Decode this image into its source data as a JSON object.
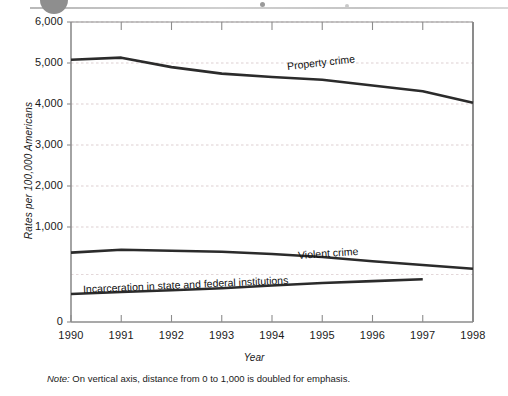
{
  "figure": {
    "note_prefix": "Note:",
    "note_text": " On vertical axis, distance from 0 to 1,000 is doubled for emphasis.",
    "artifact": {
      "circle": "scan-artifact-circle",
      "rule": "scan-artifact-rule"
    }
  },
  "chart_data": {
    "type": "line",
    "title": "",
    "xlabel": "Year",
    "ylabel": "Rates per 100,000 Americans",
    "x": [
      1990,
      1991,
      1992,
      1993,
      1994,
      1995,
      1996,
      1997,
      1998
    ],
    "xtick_labels": [
      "1990",
      "1991",
      "1992",
      "1993",
      "1994",
      "1995",
      "1996",
      "1997",
      "1998"
    ],
    "ytick_labels": [
      "0",
      "1,000",
      "2,000",
      "3,000",
      "4,000",
      "5,000",
      "6,000"
    ],
    "ytick_values": [
      0,
      1000,
      2000,
      3000,
      4000,
      5000,
      6000
    ],
    "ylim": [
      0,
      6000
    ],
    "xlim": [
      1990,
      1998
    ],
    "grid": "horizontal-dashed-light",
    "legend_position": "inline-annotations",
    "axis_note": "Vertical axis is non-linear: the 0 to 1,000 band is drawn at double scale for emphasis.",
    "series": [
      {
        "name": "Property crime",
        "label": "Property crime",
        "color": "#2b2b2b",
        "x": [
          1990,
          1991,
          1992,
          1993,
          1994,
          1995,
          1996,
          1997,
          1998
        ],
        "values": [
          5080,
          5130,
          4900,
          4740,
          4660,
          4590,
          4450,
          4310,
          4030
        ]
      },
      {
        "name": "Violent crime",
        "label": "Violent crime",
        "color": "#2b2b2b",
        "x": [
          1990,
          1991,
          1992,
          1993,
          1994,
          1995,
          1996,
          1997,
          1998
        ],
        "values": [
          730,
          760,
          750,
          740,
          715,
          685,
          640,
          600,
          560
        ]
      },
      {
        "name": "Incarceration in state and federal institutions",
        "label": "Incarceration in state and federal institutions",
        "color": "#2b2b2b",
        "x": [
          1990,
          1991,
          1992,
          1993,
          1994,
          1995,
          1996,
          1997
        ],
        "values": [
          295,
          315,
          335,
          355,
          385,
          410,
          430,
          450
        ]
      }
    ]
  }
}
